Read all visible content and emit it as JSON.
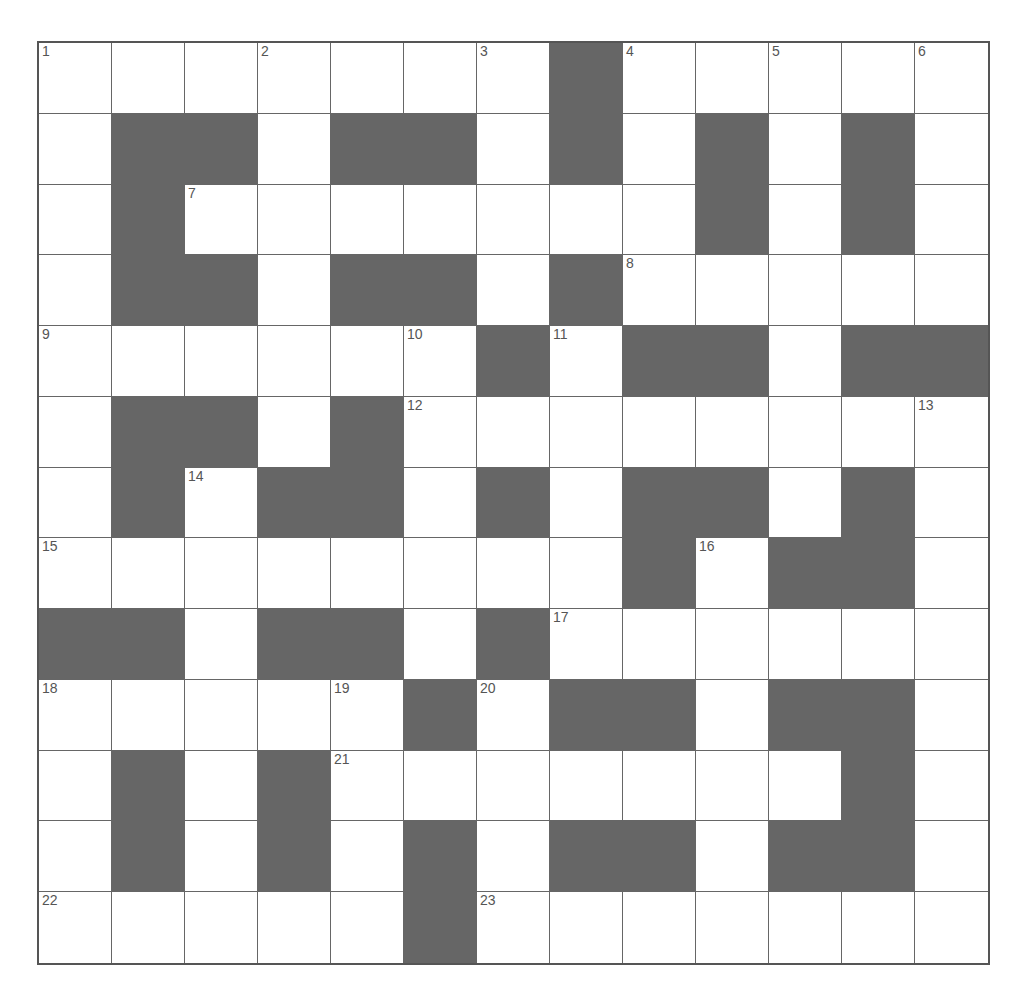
{
  "puzzle": {
    "rows": 13,
    "cols": 13,
    "colors": {
      "block": "#666666",
      "cell": "#ffffff",
      "line": "#666666",
      "number": "#555555"
    },
    "grid": [
      "WWWWWWWBWWWWW",
      "WBBWBBWBWBWBW",
      "WBWWWWWWWBWBW",
      "WBBWBBWBWWWWW",
      "WWWWWWBWBBWBB",
      "WBBWBWWWWWWWW",
      "WBWBBWBWBBWBW",
      "WWWWWWWWBWBBW",
      "BBWBBWBWWWWWW",
      "WWWWWBWBBWBBW",
      "WBWBWWWWWWWBW",
      "WBWBWBWBBWBBW",
      "WWWWWBWWWWWWW"
    ],
    "numbers": [
      {
        "r": 0,
        "c": 0,
        "n": "1"
      },
      {
        "r": 0,
        "c": 3,
        "n": "2"
      },
      {
        "r": 0,
        "c": 6,
        "n": "3"
      },
      {
        "r": 0,
        "c": 8,
        "n": "4"
      },
      {
        "r": 0,
        "c": 10,
        "n": "5"
      },
      {
        "r": 0,
        "c": 12,
        "n": "6"
      },
      {
        "r": 2,
        "c": 2,
        "n": "7"
      },
      {
        "r": 3,
        "c": 8,
        "n": "8"
      },
      {
        "r": 4,
        "c": 0,
        "n": "9"
      },
      {
        "r": 4,
        "c": 5,
        "n": "10"
      },
      {
        "r": 4,
        "c": 7,
        "n": "11"
      },
      {
        "r": 5,
        "c": 5,
        "n": "12"
      },
      {
        "r": 5,
        "c": 12,
        "n": "13"
      },
      {
        "r": 6,
        "c": 2,
        "n": "14"
      },
      {
        "r": 7,
        "c": 0,
        "n": "15"
      },
      {
        "r": 7,
        "c": 9,
        "n": "16"
      },
      {
        "r": 8,
        "c": 7,
        "n": "17"
      },
      {
        "r": 9,
        "c": 0,
        "n": "18"
      },
      {
        "r": 9,
        "c": 4,
        "n": "19"
      },
      {
        "r": 9,
        "c": 6,
        "n": "20"
      },
      {
        "r": 10,
        "c": 4,
        "n": "21"
      },
      {
        "r": 12,
        "c": 0,
        "n": "22"
      },
      {
        "r": 12,
        "c": 6,
        "n": "23"
      }
    ]
  }
}
